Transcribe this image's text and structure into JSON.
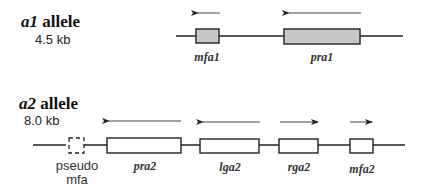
{
  "alleles": [
    {
      "name_italic": "a1",
      "name_suffix": " allele",
      "size": "4.5 kb",
      "genes": [
        {
          "label": "mfa1",
          "fill": "#c8c8c8",
          "direction": "left"
        },
        {
          "label": "pra1",
          "fill": "#c8c8c8",
          "direction": "left"
        }
      ]
    },
    {
      "name_italic": "a2",
      "name_suffix": " allele",
      "size": "8.0 kb",
      "pseudo": {
        "line1": "pseudo",
        "line2": "mfa"
      },
      "genes": [
        {
          "label": "pra2",
          "fill": "#ffffff",
          "direction": "left"
        },
        {
          "label": "lga2",
          "fill": "#ffffff",
          "direction": "left"
        },
        {
          "label": "rga2",
          "fill": "#ffffff",
          "direction": "right"
        },
        {
          "label": "mfa2",
          "fill": "#ffffff",
          "direction": "right"
        }
      ]
    }
  ]
}
